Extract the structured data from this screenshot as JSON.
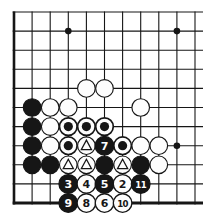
{
  "page": {
    "background": "#ffffff"
  },
  "diagram": {
    "board": {
      "cols": 11,
      "rows": 11,
      "origin_x": 14,
      "origin_y": 12,
      "spacing_x": 18.1,
      "spacing_y": 19.1,
      "ink_color": "#161616",
      "paper_color": "#fdfdfd",
      "line_width": 1.1,
      "edge_left_width": 2.6,
      "edge_bottom_width": 2.9,
      "right_bleed": 8,
      "stone_radius": 8.8,
      "numbered_stone_radius": 9.3,
      "circle_mark_inner_radius": 4.6,
      "star_point_radius": 3.3,
      "star_points": [
        {
          "col": 4,
          "row": 2
        },
        {
          "col": 10,
          "row": 2
        },
        {
          "col": 10,
          "row": 8
        }
      ]
    },
    "stones": [
      {
        "col": 5,
        "row": 5,
        "color": "white",
        "mark": "",
        "number": ""
      },
      {
        "col": 6,
        "row": 5,
        "color": "white",
        "mark": "",
        "number": ""
      },
      {
        "col": 2,
        "row": 6,
        "color": "black",
        "mark": "",
        "number": ""
      },
      {
        "col": 3,
        "row": 6,
        "color": "white",
        "mark": "",
        "number": ""
      },
      {
        "col": 4,
        "row": 6,
        "color": "white",
        "mark": "",
        "number": ""
      },
      {
        "col": 8,
        "row": 6,
        "color": "white",
        "mark": "",
        "number": ""
      },
      {
        "col": 2,
        "row": 7,
        "color": "black",
        "mark": "",
        "number": ""
      },
      {
        "col": 3,
        "row": 7,
        "color": "white",
        "mark": "",
        "number": ""
      },
      {
        "col": 4,
        "row": 7,
        "color": "black",
        "mark": "circle",
        "number": ""
      },
      {
        "col": 5,
        "row": 7,
        "color": "black",
        "mark": "circle",
        "number": ""
      },
      {
        "col": 6,
        "row": 7,
        "color": "black",
        "mark": "circle",
        "number": ""
      },
      {
        "col": 2,
        "row": 8,
        "color": "black",
        "mark": "",
        "number": ""
      },
      {
        "col": 3,
        "row": 8,
        "color": "white",
        "mark": "",
        "number": ""
      },
      {
        "col": 4,
        "row": 8,
        "color": "black",
        "mark": "circle",
        "number": ""
      },
      {
        "col": 5,
        "row": 8,
        "color": "white",
        "mark": "triangle",
        "number": ""
      },
      {
        "col": 6,
        "row": 8,
        "color": "black",
        "mark": "",
        "number": "7"
      },
      {
        "col": 7,
        "row": 8,
        "color": "black",
        "mark": "circle",
        "number": ""
      },
      {
        "col": 8,
        "row": 8,
        "color": "white",
        "mark": "",
        "number": ""
      },
      {
        "col": 9,
        "row": 8,
        "color": "white",
        "mark": "",
        "number": ""
      },
      {
        "col": 2,
        "row": 9,
        "color": "black",
        "mark": "",
        "number": ""
      },
      {
        "col": 3,
        "row": 9,
        "color": "black",
        "mark": "",
        "number": ""
      },
      {
        "col": 4,
        "row": 9,
        "color": "white",
        "mark": "triangle",
        "number": ""
      },
      {
        "col": 5,
        "row": 9,
        "color": "white",
        "mark": "triangle",
        "number": ""
      },
      {
        "col": 6,
        "row": 9,
        "color": "black",
        "mark": "",
        "number": ""
      },
      {
        "col": 7,
        "row": 9,
        "color": "white",
        "mark": "triangle",
        "number": ""
      },
      {
        "col": 8,
        "row": 9,
        "color": "black",
        "mark": "",
        "number": ""
      },
      {
        "col": 9,
        "row": 9,
        "color": "white",
        "mark": "",
        "number": ""
      },
      {
        "col": 4,
        "row": 10,
        "color": "black",
        "mark": "",
        "number": "3"
      },
      {
        "col": 5,
        "row": 10,
        "color": "white",
        "mark": "",
        "number": "4"
      },
      {
        "col": 6,
        "row": 10,
        "color": "black",
        "mark": "",
        "number": "5"
      },
      {
        "col": 7,
        "row": 10,
        "color": "white",
        "mark": "",
        "number": "2"
      },
      {
        "col": 8,
        "row": 10,
        "color": "black",
        "mark": "",
        "number": "11"
      },
      {
        "col": 4,
        "row": 11,
        "color": "black",
        "mark": "",
        "number": "9"
      },
      {
        "col": 5,
        "row": 11,
        "color": "white",
        "mark": "",
        "number": "8"
      },
      {
        "col": 6,
        "row": 11,
        "color": "white",
        "mark": "",
        "number": "6"
      },
      {
        "col": 7,
        "row": 11,
        "color": "white",
        "mark": "",
        "number": "10"
      }
    ]
  }
}
